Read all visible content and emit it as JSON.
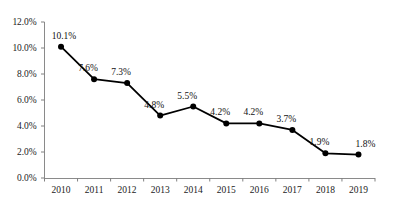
{
  "chart_data": {
    "type": "line",
    "title": "",
    "subtitle": "",
    "xlabel": "",
    "ylabel": "",
    "categories": [
      "2010",
      "2011",
      "2012",
      "2013",
      "2014",
      "2015",
      "2016",
      "2017",
      "2018",
      "2019"
    ],
    "values": [
      10.1,
      7.6,
      7.3,
      4.8,
      5.5,
      4.2,
      4.2,
      3.7,
      1.9,
      1.8
    ],
    "point_labels": [
      "10.1%",
      "7.6%",
      "7.3%",
      "4.8%",
      "5.5%",
      "4.2%",
      "4.2%",
      "3.7%",
      "1.9%",
      "1.8%"
    ],
    "ylim": [
      0,
      12
    ],
    "ytick_values": [
      0,
      2,
      4,
      6,
      8,
      10,
      12
    ],
    "ytick_labels": [
      "0.0%",
      "2.0%",
      "4.0%",
      "6.0%",
      "8.0%",
      "10.0%",
      "12.0%"
    ],
    "unit": "%",
    "grid": false,
    "legend": null,
    "legend_position": "none",
    "series": [
      {
        "name": "",
        "values": [
          10.1,
          7.6,
          7.3,
          4.8,
          5.5,
          4.2,
          4.2,
          3.7,
          1.9,
          1.8
        ],
        "line_color": "#000000",
        "marker": "circle",
        "marker_color": "#000000"
      }
    ],
    "colors": {
      "line": "#000000",
      "marker": "#000000",
      "axis": "#808080",
      "text": "#1b1b1b",
      "background": "#ffffff"
    }
  }
}
